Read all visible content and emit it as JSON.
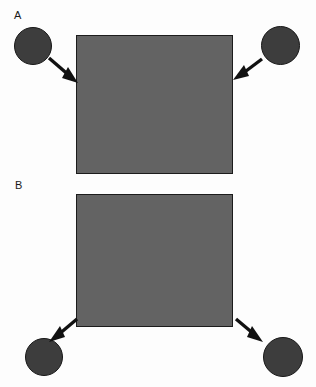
{
  "figure": {
    "width": 316,
    "height": 387,
    "background_color": "#fdfdfd"
  },
  "colors": {
    "background": "#fdfdfd",
    "rectangle_fill": "#636363",
    "rectangle_stroke": "#1c1c1c",
    "circle_fill": "#3d3d3d",
    "circle_stroke": "#171717",
    "arrow": "#111111",
    "label_text": "#1a1a1a"
  },
  "panels": [
    {
      "id": "a",
      "label": "A",
      "label_position": {
        "x": 14,
        "y": 10
      },
      "rectangle": {
        "x": 76,
        "y": 35,
        "width": 157,
        "height": 139
      },
      "circles": [
        {
          "id": "a-left",
          "x": 14,
          "y": 27,
          "diameter": 38
        },
        {
          "id": "a-right",
          "x": 261,
          "y": 26,
          "diameter": 39
        }
      ],
      "arrows": [
        {
          "id": "a-left-arrow",
          "direction": "down-right",
          "from": {
            "x": 49,
            "y": 58
          },
          "to": {
            "x": 77,
            "y": 82
          },
          "points_to": "rectangle-left-edge"
        },
        {
          "id": "a-right-arrow",
          "direction": "down-left",
          "from": {
            "x": 262,
            "y": 59
          },
          "to": {
            "x": 234,
            "y": 79
          },
          "points_to": "rectangle-right-edge"
        }
      ]
    },
    {
      "id": "b",
      "label": "B",
      "label_position": {
        "x": 15,
        "y": 180
      },
      "rectangle": {
        "x": 76,
        "y": 194,
        "width": 157,
        "height": 133
      },
      "circles": [
        {
          "id": "b-left",
          "x": 25,
          "y": 338,
          "diameter": 38
        },
        {
          "id": "b-right",
          "x": 263,
          "y": 337,
          "diameter": 40
        }
      ],
      "arrows": [
        {
          "id": "b-left-arrow",
          "direction": "down-left",
          "from": {
            "x": 77,
            "y": 319
          },
          "to": {
            "x": 50,
            "y": 341
          },
          "points_to": "circle-b-left"
        },
        {
          "id": "b-right-arrow",
          "direction": "down-right",
          "from": {
            "x": 236,
            "y": 319
          },
          "to": {
            "x": 262,
            "y": 341
          },
          "points_to": "circle-b-right"
        }
      ]
    }
  ]
}
